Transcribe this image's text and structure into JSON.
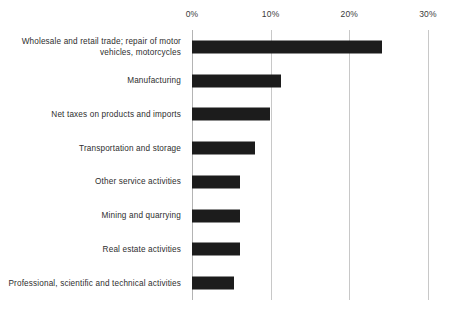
{
  "chart_data": {
    "type": "bar",
    "orientation": "horizontal",
    "title": "",
    "subtitle": "",
    "xlabel": "",
    "ylabel": "",
    "xlim": [
      0,
      30
    ],
    "x_tick_labels": [
      "0%",
      "10%",
      "20%",
      "30%"
    ],
    "x_ticks": [
      0,
      10,
      20,
      30
    ],
    "grid": true,
    "legend": null,
    "unit": "%",
    "bar_color": "#1c1c1c",
    "gridline_color": "#c8c8c8",
    "background_color": "#ffffff",
    "categories": [
      "Wholesale and retail trade; repair of motor vehicles, motorcycles",
      "Manufacturing",
      "Net taxes on products and imports",
      "Transportation and storage",
      "Other service activities",
      "Mining and quarrying",
      "Real estate activities",
      "Professional, scientific and technical activities"
    ],
    "values": [
      24.1,
      11.3,
      9.9,
      8.0,
      6.1,
      6.1,
      6.1,
      5.3
    ]
  }
}
